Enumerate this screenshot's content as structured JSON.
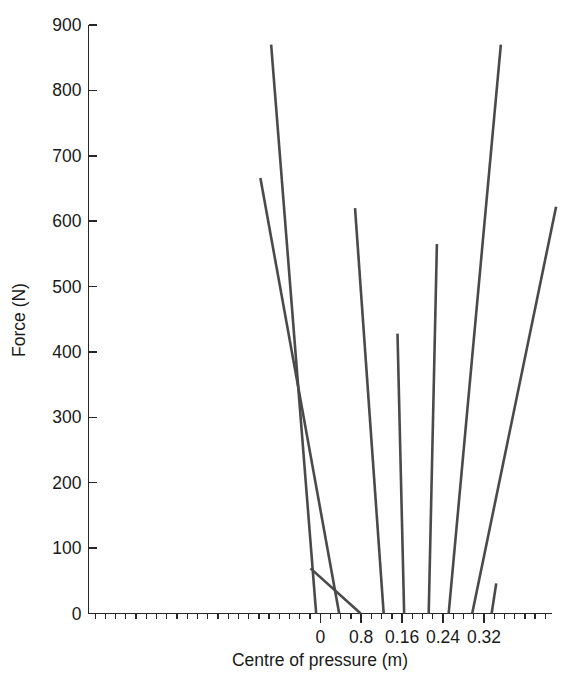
{
  "chart_data": {
    "type": "line",
    "title": "",
    "xlabel": "Centre of pressure (m)",
    "ylabel": "Force (N)",
    "xlim": [
      -0.0453,
      0.0453
    ],
    "ylim": [
      0,
      900
    ],
    "grid": false,
    "legend": "none",
    "xtick_labels": [
      "0",
      "0.8",
      "0.16",
      "0.24",
      "0.32"
    ],
    "xtick_values": [
      0,
      0.008,
      0.016,
      0.024,
      0.032
    ],
    "ytick_labels": [
      "0",
      "100",
      "200",
      "300",
      "400",
      "500",
      "600",
      "700",
      "800",
      "900"
    ],
    "ytick_values": [
      0,
      100,
      200,
      300,
      400,
      500,
      600,
      700,
      800,
      900
    ],
    "x_minor_tick_interval": 0.002,
    "line_color": "#4a4a4a",
    "axis_color": "#262626",
    "background": "#ffffff",
    "series": [
      {
        "name": "trace-1",
        "x": [
          -0.0008,
          -0.0096
        ],
        "y": [
          0,
          870
        ],
        "base_x": -0.0008,
        "peak_x": -0.0096,
        "peak_force": 870
      },
      {
        "name": "trace-2",
        "x": [
          0.0037,
          -0.0117
        ],
        "y": [
          0,
          666
        ],
        "base_x": 0.0037,
        "peak_x": -0.0117,
        "peak_force": 666
      },
      {
        "name": "trace-3",
        "x": [
          0.0079,
          -0.0019
        ],
        "y": [
          0,
          69
        ],
        "base_x": 0.0079,
        "peak_x": -0.0019,
        "peak_force": 69
      },
      {
        "name": "trace-4",
        "x": [
          0.0124,
          0.0068
        ],
        "y": [
          0,
          620
        ],
        "base_x": 0.0124,
        "peak_x": 0.0068,
        "peak_force": 620
      },
      {
        "name": "trace-5",
        "x": [
          0.0164,
          0.0151
        ],
        "y": [
          0,
          428
        ],
        "base_x": 0.0164,
        "peak_x": 0.0151,
        "peak_force": 428
      },
      {
        "name": "trace-6",
        "x": [
          0.0212,
          0.0228
        ],
        "y": [
          0,
          565
        ],
        "base_x": 0.0212,
        "peak_x": 0.0228,
        "peak_force": 565
      },
      {
        "name": "trace-7",
        "x": [
          0.0251,
          0.0353
        ],
        "y": [
          0,
          870
        ],
        "base_x": 0.0251,
        "peak_x": 0.0353,
        "peak_force": 870
      },
      {
        "name": "trace-8",
        "x": [
          0.0297,
          0.0461
        ],
        "y": [
          0,
          622
        ],
        "base_x": 0.0297,
        "peak_x": 0.0461,
        "peak_force": 622
      },
      {
        "name": "trace-9",
        "x": [
          0.0335,
          0.0344
        ],
        "y": [
          0,
          46
        ],
        "base_x": 0.0335,
        "peak_x": 0.0344,
        "peak_force": 46
      }
    ]
  }
}
